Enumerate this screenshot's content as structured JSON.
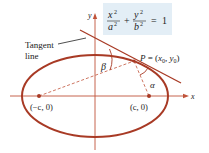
{
  "equation": {
    "term1_num": "x",
    "term1_den": "a",
    "term2_num": "y",
    "term2_den": "b",
    "exp": "2",
    "plus": "+",
    "equals": "=",
    "rhs": "1"
  },
  "labels": {
    "y_axis": "y",
    "x_axis": "x",
    "tangent_line_1": "Tangent",
    "tangent_line_2": "line",
    "point_p": "P = (x",
    "point_p_sub0": "0",
    "point_p_mid": ", y",
    "point_p_sub1": "0",
    "point_p_end": ")",
    "left_focus": "(−c, 0)",
    "right_focus": "(c, 0)",
    "beta": "β",
    "alpha": "α"
  },
  "colors": {
    "curve": "#a83a25",
    "axis": "#b5442c",
    "box": "#e3eef6",
    "text": "#222222"
  }
}
